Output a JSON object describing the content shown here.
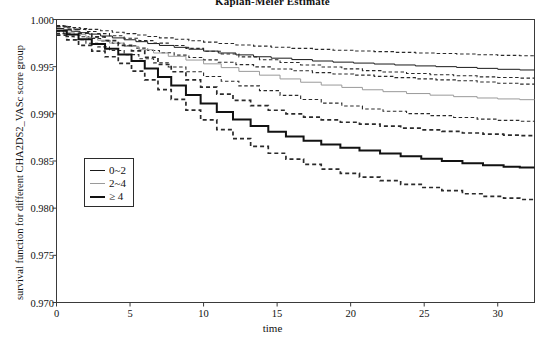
{
  "chart_data": {
    "type": "line",
    "subtype": "kaplan-meier-step",
    "title": "Kaplan-Meier Estimate",
    "xlabel": "time",
    "ylabel": "survival function for different CHA2DS2_VASc score group",
    "xlim": [
      0,
      32.5
    ],
    "ylim": [
      0.97,
      1.0
    ],
    "xticks": [
      0,
      5,
      10,
      15,
      20,
      25,
      30
    ],
    "xtick_labels": [
      "0",
      "5",
      "10",
      "15",
      "20",
      "25",
      "30"
    ],
    "yticks": [
      0.97,
      0.975,
      0.98,
      0.985,
      0.99,
      0.995,
      1.0
    ],
    "ytick_labels": [
      "0.970",
      "0.975",
      "0.980",
      "0.985",
      "0.990",
      "0.995",
      "1.000"
    ],
    "grid": false,
    "legend_position": "center-left",
    "colors": {
      "group_0_2": "#1a1a1a",
      "group_2_4": "#9a9a9a",
      "group_ge_4": "#121212",
      "confidence_band": "#2a2a2a",
      "axis": "#3a3a3a"
    },
    "series": [
      {
        "name": "0~2",
        "label": "0~2",
        "color": "#1a1a1a",
        "line_width": 1.0,
        "line_style": "solid",
        "x": [
          0,
          0.5,
          1,
          1.6,
          2.2,
          3,
          3.8,
          4.6,
          5.4,
          6.2,
          7,
          8,
          9,
          10,
          11,
          12.2,
          13.4,
          14.6,
          16,
          17.4,
          18.8,
          20.2,
          21.6,
          23,
          24.4,
          25.8,
          27.2,
          28.6,
          30,
          31.5
        ],
        "y": [
          0.99905,
          0.9989,
          0.99875,
          0.9986,
          0.99845,
          0.99825,
          0.99805,
          0.99785,
          0.99765,
          0.99745,
          0.99725,
          0.99705,
          0.99685,
          0.99665,
          0.99645,
          0.99625,
          0.99605,
          0.9959,
          0.99575,
          0.9956,
          0.99548,
          0.99538,
          0.99528,
          0.99518,
          0.99508,
          0.995,
          0.99492,
          0.99482,
          0.99472,
          0.99465
        ],
        "ci_upper": [
          0.99935,
          0.99925,
          0.99915,
          0.99905,
          0.99895,
          0.9988,
          0.99865,
          0.9985,
          0.99835,
          0.9982,
          0.99805,
          0.9979,
          0.99775,
          0.9976,
          0.99745,
          0.9973,
          0.99718,
          0.99706,
          0.99694,
          0.99683,
          0.99674,
          0.99666,
          0.99659,
          0.99652,
          0.99645,
          0.9964,
          0.99634,
          0.99627,
          0.9962,
          0.99615
        ],
        "ci_lower": [
          0.9987,
          0.99855,
          0.99836,
          0.99817,
          0.99798,
          0.99772,
          0.99747,
          0.99722,
          0.99697,
          0.99672,
          0.99648,
          0.99622,
          0.99597,
          0.99572,
          0.99547,
          0.99522,
          0.99498,
          0.99476,
          0.99456,
          0.99437,
          0.99422,
          0.9941,
          0.99397,
          0.99384,
          0.99371,
          0.9936,
          0.9935,
          0.99337,
          0.99324,
          0.99315
        ]
      },
      {
        "name": "2~4",
        "label": "2~4",
        "color": "#9a9a9a",
        "line_width": 1.0,
        "line_style": "solid",
        "x": [
          0,
          0.6,
          1.2,
          2,
          2.8,
          3.6,
          4.6,
          5.6,
          6.6,
          7.6,
          8.8,
          10,
          11.2,
          12.4,
          13.8,
          15.2,
          16.6,
          18,
          19.4,
          20.8,
          22.2,
          23.8,
          25.4,
          27,
          28.6,
          30,
          31.5
        ],
        "y": [
          0.9989,
          0.99865,
          0.9984,
          0.9981,
          0.9978,
          0.9975,
          0.99715,
          0.9968,
          0.99645,
          0.9961,
          0.9957,
          0.9953,
          0.9949,
          0.9945,
          0.9941,
          0.9937,
          0.99335,
          0.99305,
          0.9928,
          0.99255,
          0.99235,
          0.99215,
          0.99198,
          0.99182,
          0.99168,
          0.99158,
          0.9915
        ],
        "ci_upper": [
          0.9993,
          0.99912,
          0.99894,
          0.99872,
          0.9985,
          0.99828,
          0.99802,
          0.99776,
          0.9975,
          0.99724,
          0.99694,
          0.99664,
          0.99634,
          0.99604,
          0.99574,
          0.99544,
          0.99518,
          0.99496,
          0.99477,
          0.99458,
          0.99443,
          0.99428,
          0.99415,
          0.99403,
          0.99392,
          0.99385,
          0.99379
        ],
        "ci_lower": [
          0.9985,
          0.99818,
          0.99786,
          0.99748,
          0.9971,
          0.99672,
          0.99628,
          0.99584,
          0.9954,
          0.99496,
          0.99446,
          0.99396,
          0.99346,
          0.99296,
          0.99246,
          0.99196,
          0.99152,
          0.99114,
          0.99083,
          0.99052,
          0.99027,
          0.99002,
          0.98981,
          0.98961,
          0.98944,
          0.98931,
          0.98921
        ]
      },
      {
        "name": "≥ 4",
        "label": "≥ 4",
        "color": "#121212",
        "line_width": 2.0,
        "line_style": "solid",
        "x": [
          0,
          0.7,
          1.5,
          2.4,
          3.3,
          4.2,
          5.1,
          6,
          6.9,
          7.8,
          8.8,
          9.8,
          10.9,
          12,
          13.2,
          14.4,
          15.6,
          16.8,
          18,
          19.3,
          20.6,
          22,
          23.4,
          24.8,
          26.2,
          27.6,
          29,
          30.4,
          31.5
        ],
        "y": [
          0.9988,
          0.9984,
          0.9979,
          0.9974,
          0.9969,
          0.9963,
          0.9956,
          0.9948,
          0.9939,
          0.993,
          0.992,
          0.9911,
          0.9902,
          0.9894,
          0.9887,
          0.9881,
          0.9876,
          0.98715,
          0.98675,
          0.9864,
          0.9861,
          0.9858,
          0.9855,
          0.98525,
          0.985,
          0.98475,
          0.98455,
          0.9844,
          0.9843
        ],
        "ci_upper": [
          0.99925,
          0.99895,
          0.99855,
          0.99815,
          0.99775,
          0.99726,
          0.99668,
          0.996,
          0.99523,
          0.99446,
          0.9936,
          0.99284,
          0.99208,
          0.99142,
          0.99086,
          0.99038,
          0.99,
          0.98966,
          0.98936,
          0.98911,
          0.9889,
          0.98869,
          0.98848,
          0.98831,
          0.98814,
          0.98797,
          0.98784,
          0.98774,
          0.98768
        ],
        "ci_lower": [
          0.99835,
          0.99785,
          0.99725,
          0.99665,
          0.99605,
          0.99534,
          0.99452,
          0.9936,
          0.99257,
          0.99154,
          0.9904,
          0.98936,
          0.98832,
          0.98738,
          0.98654,
          0.98582,
          0.9852,
          0.98464,
          0.98414,
          0.98369,
          0.9833,
          0.98291,
          0.98252,
          0.98219,
          0.98186,
          0.98153,
          0.98126,
          0.98106,
          0.98092
        ]
      }
    ],
    "confidence_band_style": "dashed",
    "legend_entries": [
      {
        "label": "0~2",
        "color": "#1a1a1a",
        "width": 1.0
      },
      {
        "label": "2~4",
        "color": "#9a9a9a",
        "width": 1.0
      },
      {
        "label": "≥ 4",
        "color": "#121212",
        "width": 2.0
      }
    ]
  }
}
